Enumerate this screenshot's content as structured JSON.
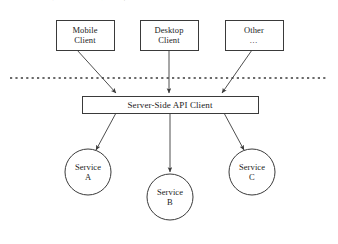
{
  "figure": {
    "width": 338,
    "height": 244,
    "background_color": "#ffffff",
    "stroke_color": "#3a3a3a",
    "text_color": "#1b1b1b",
    "caption_partial_text": "图２－４  服务端 API 客户端架构示意图"
  },
  "clients": [
    {
      "id": "mobile-client",
      "line1": "Mobile",
      "line2": "Client",
      "x": 56,
      "y": 20,
      "width": 58,
      "height": 30
    },
    {
      "id": "desktop-client",
      "line1": "Desktop",
      "line2": "Client",
      "x": 140,
      "y": 20,
      "width": 58,
      "height": 30
    },
    {
      "id": "other-client",
      "line1": "Other",
      "line2": "…",
      "x": 225,
      "y": 20,
      "width": 58,
      "height": 30
    }
  ],
  "divider": {
    "id": "network-boundary",
    "style": "dotted",
    "x1": 10,
    "x2": 326,
    "y": 78
  },
  "server": {
    "id": "server-side-api-client",
    "label": "Server-Side API Client",
    "x": 82,
    "y": 96,
    "width": 176,
    "height": 17
  },
  "services": [
    {
      "id": "service-a",
      "line1": "Service",
      "line2": "A",
      "cx": 88,
      "cy": 172,
      "r": 23
    },
    {
      "id": "service-b",
      "line1": "Service",
      "line2": "B",
      "cx": 170,
      "cy": 197,
      "r": 23
    },
    {
      "id": "service-c",
      "line1": "Service",
      "line2": "C",
      "cx": 252,
      "cy": 172,
      "r": 23
    }
  ],
  "arrows": [
    {
      "id": "arrow-mobile-to-server",
      "from": "mobile-client",
      "to": "server-side-api-client",
      "x1": 77,
      "y1": 50,
      "x2": 116,
      "y2": 93
    },
    {
      "id": "arrow-desktop-to-server",
      "from": "desktop-client",
      "to": "server-side-api-client",
      "x1": 169,
      "y1": 50,
      "x2": 169,
      "y2": 93
    },
    {
      "id": "arrow-other-to-server",
      "from": "other-client",
      "to": "server-side-api-client",
      "x1": 252,
      "y1": 50,
      "x2": 222,
      "y2": 93
    },
    {
      "id": "arrow-server-to-service-a",
      "from": "server-side-api-client",
      "to": "service-a",
      "x1": 116,
      "y1": 113,
      "x2": 96,
      "y2": 150
    },
    {
      "id": "arrow-server-to-service-b",
      "from": "server-side-api-client",
      "to": "service-b",
      "x1": 170,
      "y1": 113,
      "x2": 170,
      "y2": 172
    },
    {
      "id": "arrow-server-to-service-c",
      "from": "server-side-api-client",
      "to": "service-c",
      "x1": 224,
      "y1": 113,
      "x2": 244,
      "y2": 150
    }
  ]
}
